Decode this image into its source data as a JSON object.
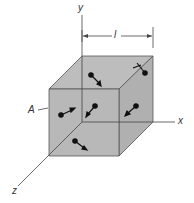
{
  "figure": {
    "labels": {
      "y_axis": "y",
      "x_axis": "x",
      "z_axis": "z",
      "edge_length": "l",
      "face": "A"
    },
    "colors": {
      "cube_fill": "#b5b5b5",
      "lines": "#333333",
      "molecules": "#111111"
    }
  }
}
